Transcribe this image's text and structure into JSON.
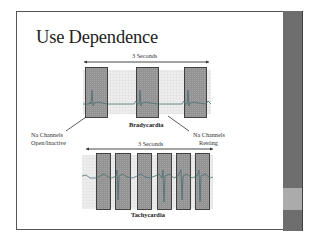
{
  "slide": {
    "title": "Use Dependence",
    "colors": {
      "sidebar_dark": "#6e6e6e",
      "sidebar_light": "#ababab",
      "frame": "#555555",
      "grid": "#d8d8d8",
      "box_fill": "#8c8c8c",
      "trace": "#3f6b6b"
    }
  },
  "bradycardia": {
    "duration_label": "3 Seconds",
    "caption": "Bradycardia",
    "boxes": 3
  },
  "tachycardia": {
    "duration_label": "3 Seconds",
    "caption": "Tachycardia",
    "boxes": 6
  },
  "annotations": {
    "left_line1": "Na Channels",
    "left_line2": "Open/Inactive",
    "right_line1": "Na Channels",
    "right_line2": "Resting"
  }
}
